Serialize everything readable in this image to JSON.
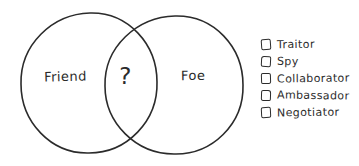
{
  "venn": {
    "left_label": "Friend",
    "intersection_label": "?",
    "right_label": "Foe"
  },
  "checklist": {
    "items": [
      {
        "label": "Traitor",
        "checked": false
      },
      {
        "label": "Spy",
        "checked": false
      },
      {
        "label": "Collaborator",
        "checked": false
      },
      {
        "label": "Ambassador",
        "checked": false
      },
      {
        "label": "Negotiator",
        "checked": false
      }
    ]
  },
  "icons": {
    "checkbox": "unchecked-checkbox-icon"
  },
  "colors": {
    "ink": "#2b2b2b",
    "background": "#ffffff"
  }
}
